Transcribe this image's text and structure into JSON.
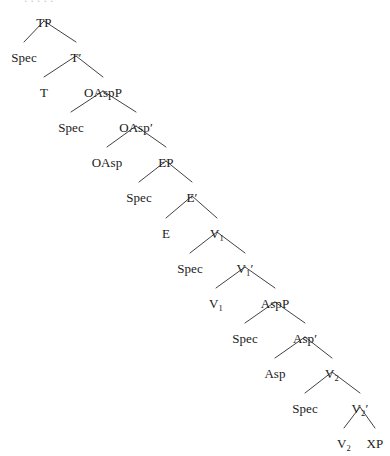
{
  "diagram": {
    "type": "syntax-tree",
    "line_color": "#2b2b2b",
    "background_color": "#ffffff",
    "text_color": "#1a1a1a",
    "nodes": [
      {
        "id": "TP",
        "label": "TP",
        "base": "TP",
        "sub": "",
        "prime": false,
        "x": 44,
        "y": 16
      },
      {
        "id": "Spec1",
        "label": "Spec",
        "base": "Spec",
        "sub": "",
        "prime": false,
        "x": 24,
        "y": 51
      },
      {
        "id": "Tbar",
        "label": "T'",
        "base": "T",
        "sub": "",
        "prime": true,
        "x": 76,
        "y": 51
      },
      {
        "id": "T",
        "label": "T",
        "base": "T",
        "sub": "",
        "prime": false,
        "x": 44,
        "y": 86
      },
      {
        "id": "OAspP",
        "label": "OAspP",
        "base": "OAspP",
        "sub": "",
        "prime": false,
        "x": 103,
        "y": 86
      },
      {
        "id": "Spec2",
        "label": "Spec",
        "base": "Spec",
        "sub": "",
        "prime": false,
        "x": 71,
        "y": 121
      },
      {
        "id": "OAspbar",
        "label": "OAsp'",
        "base": "OAsp",
        "sub": "",
        "prime": true,
        "x": 136,
        "y": 121
      },
      {
        "id": "OAsp",
        "label": "OAsp",
        "base": "OAsp",
        "sub": "",
        "prime": false,
        "x": 107,
        "y": 156
      },
      {
        "id": "EP",
        "label": "EP",
        "base": "EP",
        "sub": "",
        "prime": false,
        "x": 166,
        "y": 156
      },
      {
        "id": "Spec3",
        "label": "Spec",
        "base": "Spec",
        "sub": "",
        "prime": false,
        "x": 139,
        "y": 191
      },
      {
        "id": "Ebar",
        "label": "E'",
        "base": "E",
        "sub": "",
        "prime": true,
        "x": 192,
        "y": 191
      },
      {
        "id": "E",
        "label": "E",
        "base": "E",
        "sub": "",
        "prime": false,
        "x": 166,
        "y": 227
      },
      {
        "id": "V1P",
        "label": "V1P",
        "base": "V",
        "sub": "1",
        "prime": false,
        "x": 217,
        "y": 227
      },
      {
        "id": "Spec4",
        "label": "Spec",
        "base": "Spec",
        "sub": "",
        "prime": false,
        "x": 190,
        "y": 262
      },
      {
        "id": "V1bar",
        "label": "V1'",
        "base": "V",
        "sub": "1",
        "prime": true,
        "x": 245,
        "y": 262
      },
      {
        "id": "V1",
        "label": "V1",
        "base": "V",
        "sub": "1",
        "prime": false,
        "x": 216,
        "y": 297
      },
      {
        "id": "AspP",
        "label": "AspP",
        "base": "AspP",
        "sub": "",
        "prime": false,
        "x": 275,
        "y": 297
      },
      {
        "id": "Spec5",
        "label": "Spec",
        "base": "Spec",
        "sub": "",
        "prime": false,
        "x": 245,
        "y": 332
      },
      {
        "id": "Aspbar",
        "label": "Asp'",
        "base": "Asp",
        "sub": "",
        "prime": true,
        "x": 305,
        "y": 332
      },
      {
        "id": "Asp",
        "label": "Asp",
        "base": "Asp",
        "sub": "",
        "prime": false,
        "x": 275,
        "y": 367
      },
      {
        "id": "V2P",
        "label": "V2P",
        "base": "V",
        "sub": "2",
        "prime": false,
        "x": 332,
        "y": 367
      },
      {
        "id": "Spec6",
        "label": "Spec",
        "base": "Spec",
        "sub": "",
        "prime": false,
        "x": 305,
        "y": 402
      },
      {
        "id": "V2bar",
        "label": "V2'",
        "base": "V",
        "sub": "2",
        "prime": true,
        "x": 360,
        "y": 402
      },
      {
        "id": "V2",
        "label": "V2",
        "base": "V",
        "sub": "2",
        "prime": false,
        "x": 344,
        "y": 437
      },
      {
        "id": "XP",
        "label": "XP",
        "base": "XP",
        "sub": "",
        "prime": false,
        "x": 375,
        "y": 437
      }
    ],
    "edges": [
      {
        "from": "TP",
        "to": "Spec1"
      },
      {
        "from": "TP",
        "to": "Tbar"
      },
      {
        "from": "Tbar",
        "to": "T"
      },
      {
        "from": "Tbar",
        "to": "OAspP"
      },
      {
        "from": "OAspP",
        "to": "Spec2"
      },
      {
        "from": "OAspP",
        "to": "OAspbar"
      },
      {
        "from": "OAspbar",
        "to": "OAsp"
      },
      {
        "from": "OAspbar",
        "to": "EP"
      },
      {
        "from": "EP",
        "to": "Spec3"
      },
      {
        "from": "EP",
        "to": "Ebar"
      },
      {
        "from": "Ebar",
        "to": "E"
      },
      {
        "from": "Ebar",
        "to": "V1P"
      },
      {
        "from": "V1P",
        "to": "Spec4"
      },
      {
        "from": "V1P",
        "to": "V1bar"
      },
      {
        "from": "V1bar",
        "to": "V1"
      },
      {
        "from": "V1bar",
        "to": "AspP"
      },
      {
        "from": "AspP",
        "to": "Spec5"
      },
      {
        "from": "AspP",
        "to": "Aspbar"
      },
      {
        "from": "Aspbar",
        "to": "Asp"
      },
      {
        "from": "Aspbar",
        "to": "V2P"
      },
      {
        "from": "V2P",
        "to": "Spec6"
      },
      {
        "from": "V2P",
        "to": "V2bar"
      },
      {
        "from": "V2bar",
        "to": "V2"
      },
      {
        "from": "V2bar",
        "to": "XP"
      }
    ]
  }
}
